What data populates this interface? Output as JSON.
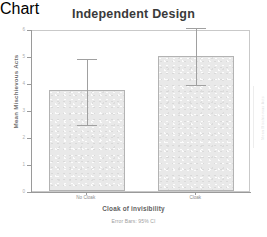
{
  "chart_data": {
    "type": "bar",
    "title": "Independent Design",
    "xlabel": "Cloak of invisibility",
    "ylabel": "Mean Mischievous Acts",
    "categories": [
      "No Cloak",
      "Cloak"
    ],
    "values": [
      3.75,
      5.0
    ],
    "error_bars": {
      "type": "95% CI",
      "lower": [
        2.53,
        4.0
      ],
      "upper": [
        4.98,
        6.1
      ]
    },
    "ylim": [
      0,
      6
    ],
    "yticks": [
      0,
      1,
      2,
      3,
      4,
      5,
      6
    ],
    "ytick_labels": [
      "0",
      "1",
      "2",
      "3",
      "4",
      "5",
      "6"
    ],
    "grid": false,
    "legend": null,
    "footnote": "Error Bars: 95% CI",
    "bar_fill_color": "#e9e9e9",
    "bar_border_color": "#b3b3b3",
    "error_bar_color": "#a0a0a0",
    "axis_color": "#9a9a9a",
    "title_color": "#3a3a3a"
  },
  "edge_artifact": {
    "text": "Mean Mischievous Acts"
  }
}
